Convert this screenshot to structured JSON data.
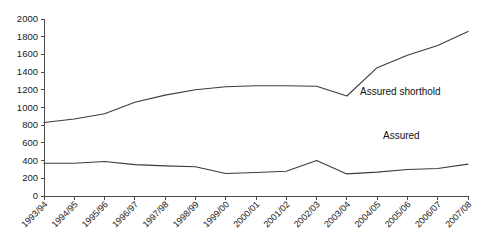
{
  "chart_data": {
    "type": "line",
    "title": "",
    "subtitle": "",
    "xlabel": "",
    "ylabel": "",
    "ylim": [
      0,
      2000
    ],
    "ytick_step": 200,
    "yticks": [
      0,
      200,
      400,
      600,
      800,
      1000,
      1200,
      1400,
      1600,
      1800,
      2000
    ],
    "ytick_labels": [
      "0",
      "200",
      "400",
      "600",
      "800",
      "1000",
      "1200",
      "1400",
      "1600",
      "1800",
      "2000"
    ],
    "grid": false,
    "legend_position": "inline-annotation",
    "categories": [
      "1993/94",
      "1994/95",
      "1995/96",
      "1996/97",
      "1997/98",
      "1998/99",
      "1999/00",
      "2000/01",
      "2001/02",
      "2002/03",
      "2003/04",
      "2004/05",
      "2005/06",
      "2006/07",
      "2007/08"
    ],
    "series": [
      {
        "name": "Assured shorthold",
        "color": "#3c3c3c",
        "annotation_label": "Assured shorthold",
        "values": [
          830,
          870,
          930,
          1060,
          1140,
          1200,
          1235,
          1245,
          1245,
          1240,
          1130,
          1450,
          1590,
          1700,
          1860
        ]
      },
      {
        "name": "Assured",
        "color": "#3c3c3c",
        "annotation_label": "Assured",
        "values": [
          370,
          370,
          390,
          355,
          340,
          330,
          255,
          265,
          280,
          400,
          250,
          270,
          300,
          310,
          360
        ]
      }
    ]
  },
  "annotations": {
    "assured_shorthold": "Assured shorthold",
    "assured": "Assured"
  }
}
